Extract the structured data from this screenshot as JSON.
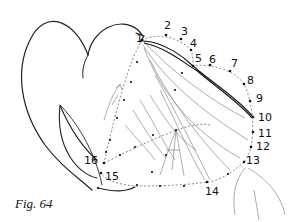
{
  "figure": {
    "caption": "Fig. 64",
    "points": [
      {
        "n": "1",
        "label": "1",
        "x": 142,
        "y": 40,
        "lx": 136,
        "ly": 33
      },
      {
        "n": "2",
        "label": "2",
        "x": 166,
        "y": 35,
        "lx": 164,
        "ly": 20
      },
      {
        "n": "3",
        "label": "3",
        "x": 181,
        "y": 39,
        "lx": 181,
        "ly": 26
      },
      {
        "n": "4",
        "label": "4",
        "x": 191,
        "y": 50,
        "lx": 190,
        "ly": 38
      },
      {
        "n": "5",
        "label": "5",
        "x": 193,
        "y": 66,
        "lx": 195,
        "ly": 53
      },
      {
        "n": "6",
        "label": "6",
        "x": 210,
        "y": 65,
        "lx": 209,
        "ly": 54
      },
      {
        "n": "7",
        "label": "7",
        "x": 230,
        "y": 71,
        "lx": 231,
        "ly": 58
      },
      {
        "n": "8",
        "label": "8",
        "x": 244,
        "y": 84,
        "lx": 247,
        "ly": 75
      },
      {
        "n": "9",
        "label": "9",
        "x": 250,
        "y": 101,
        "lx": 256,
        "ly": 93
      },
      {
        "n": "10",
        "label": "10",
        "x": 253,
        "y": 117,
        "lx": 258,
        "ly": 112
      },
      {
        "n": "11",
        "label": "11",
        "x": 253,
        "y": 132,
        "lx": 258,
        "ly": 128
      },
      {
        "n": "12",
        "label": "12",
        "x": 251,
        "y": 147,
        "lx": 256,
        "ly": 141
      },
      {
        "n": "13",
        "label": "13",
        "x": 244,
        "y": 162,
        "lx": 246,
        "ly": 155
      },
      {
        "n": "14",
        "label": "14",
        "x": 207,
        "y": 182,
        "lx": 205,
        "ly": 186
      },
      {
        "n": "15",
        "label": "15",
        "x": 101,
        "y": 173,
        "lx": 105,
        "ly": 171
      },
      {
        "n": "16",
        "label": "16",
        "x": 104,
        "y": 163,
        "lx": 84,
        "ly": 155
      }
    ]
  }
}
